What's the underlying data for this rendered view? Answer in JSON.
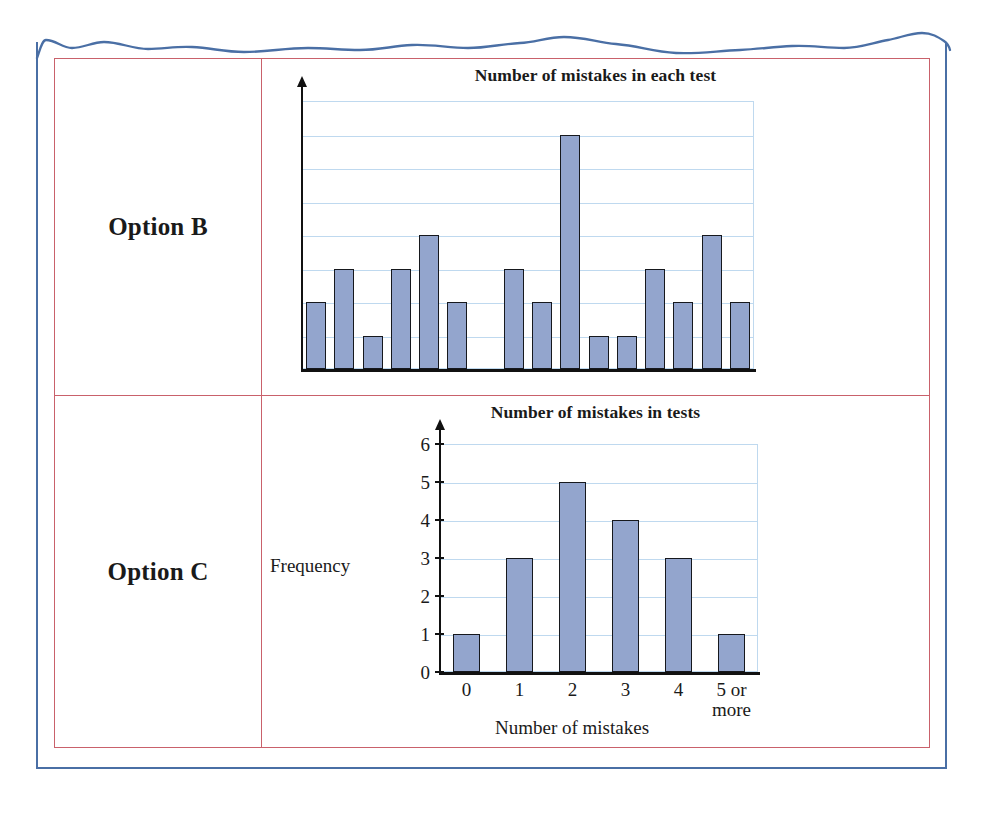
{
  "page": {
    "frame_color": "#4a6fa5",
    "table_border_color": "#c9616b",
    "bar_fill_color": "#93a5cd",
    "bar_edge_color": "#16181d",
    "gridline_color": "#bfd9ef",
    "axis_color": "#111111"
  },
  "rows": [
    {
      "label": "Option B"
    },
    {
      "label": "Option C"
    }
  ],
  "chart_data": [
    {
      "id": "option-b",
      "type": "bar",
      "title": "Number of mistakes in each test",
      "xlabel": "",
      "ylabel": "",
      "grid": true,
      "legend": "none",
      "axis_labels_shown": false,
      "ylim": [
        0,
        8
      ],
      "ygrid_step": 1,
      "categories": [
        "1",
        "2",
        "3",
        "4",
        "5",
        "6",
        "7",
        "8",
        "9",
        "10",
        "11",
        "12",
        "13",
        "14",
        "15",
        "16"
      ],
      "values": [
        2,
        3,
        1,
        3,
        4,
        2,
        0,
        3,
        2,
        7,
        1,
        1,
        3,
        2,
        4,
        2
      ],
      "note": "Unlabelled axes; each bar is one test, height read against evenly spaced horizontal gridlines."
    },
    {
      "id": "option-c",
      "type": "bar",
      "title": "Number of mistakes in tests",
      "xlabel": "Number of mistakes",
      "ylabel": "Frequency",
      "grid": true,
      "legend": "none",
      "axis_labels_shown": true,
      "ylim": [
        0,
        6
      ],
      "ygrid_step": 1,
      "ytick_labels": [
        "0",
        "1",
        "2",
        "3",
        "4",
        "5",
        "6"
      ],
      "categories": [
        "0",
        "1",
        "2",
        "3",
        "4",
        "5 or\nmore"
      ],
      "xtick_labels": [
        "0",
        "1",
        "2",
        "3",
        "4",
        "5 or more"
      ],
      "values": [
        1,
        3,
        5,
        4,
        3,
        1
      ]
    }
  ]
}
